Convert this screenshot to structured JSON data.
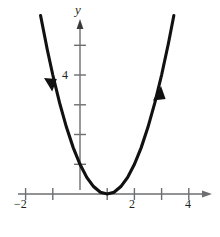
{
  "figure": {
    "name": "parabola-graph",
    "background_color": "#ffffff",
    "curve_color": "#111111",
    "axis_color": "#6d6e71",
    "text_color": "#231f20"
  },
  "axis_labels": {
    "y_axis_name": "y"
  },
  "x_tick_labels": {
    "neg2": "−2",
    "two": "2",
    "four": "4"
  },
  "y_tick_labels": {
    "four": "4"
  },
  "chart_data": {
    "type": "line",
    "title": "",
    "xlabel": "",
    "ylabel": "y",
    "xlim": [
      -2.4,
      4.6
    ],
    "ylim": [
      -0.8,
      6.2
    ],
    "grid": false,
    "legend": null,
    "function": "y = (x - 1)^2",
    "vertex": [
      1,
      0
    ],
    "y_intercept": 1,
    "x_ticks": [
      -2,
      -1,
      0,
      1,
      2,
      3,
      4
    ],
    "x_tick_labels_shown": [
      -2,
      2,
      4
    ],
    "y_ticks": [
      1,
      2,
      3,
      4,
      5
    ],
    "y_tick_labels_shown": [
      4
    ],
    "arrows": [
      {
        "branch": "left",
        "x": -1.1,
        "y": 4.4,
        "direction": "down-left"
      },
      {
        "branch": "right",
        "x": 2.8,
        "y": 3.3,
        "direction": "up-right"
      }
    ],
    "x": [
      -1.45,
      -1.2,
      -1.0,
      -0.75,
      -0.5,
      -0.25,
      0,
      0.25,
      0.5,
      0.75,
      1.0,
      1.25,
      1.5,
      1.75,
      2.0,
      2.25,
      2.5,
      2.75,
      3.0,
      3.25,
      3.45
    ],
    "y": [
      6.0,
      4.84,
      4.0,
      3.06,
      2.25,
      1.56,
      1.0,
      0.56,
      0.25,
      0.06,
      0,
      0.06,
      0.25,
      0.56,
      1.0,
      1.56,
      2.25,
      3.06,
      4.0,
      5.06,
      6.0
    ]
  }
}
